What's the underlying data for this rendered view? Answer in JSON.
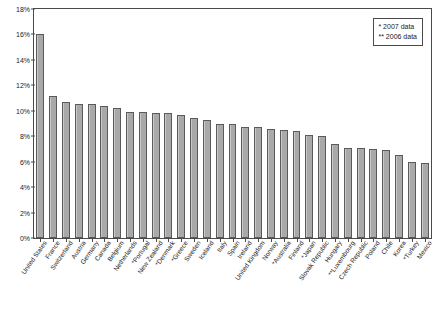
{
  "chart_data": {
    "type": "bar",
    "title": "",
    "subtitle": "",
    "xlabel": "",
    "ylabel": "",
    "ylim": [
      0,
      18
    ],
    "y_tick_labels": [
      "0%",
      "2%",
      "4%",
      "6%",
      "8%",
      "10%",
      "12%",
      "14%",
      "16%",
      "18%"
    ],
    "y_tick_values": [
      0,
      2,
      4,
      6,
      8,
      10,
      12,
      14,
      16,
      18
    ],
    "grid": false,
    "legend_position": "top-right",
    "categories": [
      "United States",
      "France",
      "Switzerland",
      "Austria",
      "Germany",
      "Canada",
      "Belgium",
      "Netherlands",
      "*Portugal",
      "New Zealand",
      "*Denmark",
      "*Greece",
      "Sweden",
      "Iceland",
      "Italy",
      "Spain",
      "Ireland",
      "United Kingdom",
      "Norway",
      "*Australia",
      "Finland",
      "*Japan",
      "Slovak Republic",
      "Hungary",
      "**Luxembourg",
      "Czech Republic",
      "Poland",
      "Chile",
      "Korea",
      "*Turkey",
      "Mexico"
    ],
    "values": [
      16.0,
      11.2,
      10.7,
      10.5,
      10.5,
      10.4,
      10.2,
      9.9,
      9.9,
      9.8,
      9.8,
      9.7,
      9.4,
      9.3,
      9.0,
      9.0,
      8.7,
      8.7,
      8.6,
      8.5,
      8.4,
      8.1,
      8.0,
      7.4,
      7.1,
      7.1,
      7.0,
      6.9,
      6.5,
      6.0,
      5.9
    ],
    "series": [
      {
        "name": "Total health expenditure as share of GDP",
        "values": [
          16.0,
          11.2,
          10.7,
          10.5,
          10.5,
          10.4,
          10.2,
          9.9,
          9.9,
          9.8,
          9.8,
          9.7,
          9.4,
          9.3,
          9.0,
          9.0,
          8.7,
          8.7,
          8.6,
          8.5,
          8.4,
          8.1,
          8.0,
          7.4,
          7.1,
          7.1,
          7.0,
          6.9,
          6.5,
          6.0,
          5.9
        ],
        "color": "#a9a9a9"
      }
    ],
    "annotations": [
      "* 2007 data",
      "** 2006 data"
    ]
  },
  "legend": {
    "note_one": "*  2007 data",
    "note_two": "** 2006 data"
  },
  "colors": {
    "bar_fill": "#a9a9a9",
    "bar_stroke": "#5a5a5a",
    "axis": "#4a4a4a",
    "text": "#1a1a1a",
    "background": "#ffffff"
  }
}
